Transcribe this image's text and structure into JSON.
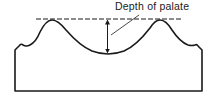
{
  "diagram": {
    "type": "cross-section",
    "annotations": [
      {
        "id": "depth-label",
        "text": "Depth of palate"
      }
    ],
    "elements": {
      "reference_line": "dashed horizontal line across peaks",
      "measurement": "double-headed vertical arrow from reference line to palate vault",
      "outline": "palate/ridge outline with base block"
    },
    "colors": {
      "stroke": "#1a1a1a",
      "background": "#ffffff"
    }
  }
}
